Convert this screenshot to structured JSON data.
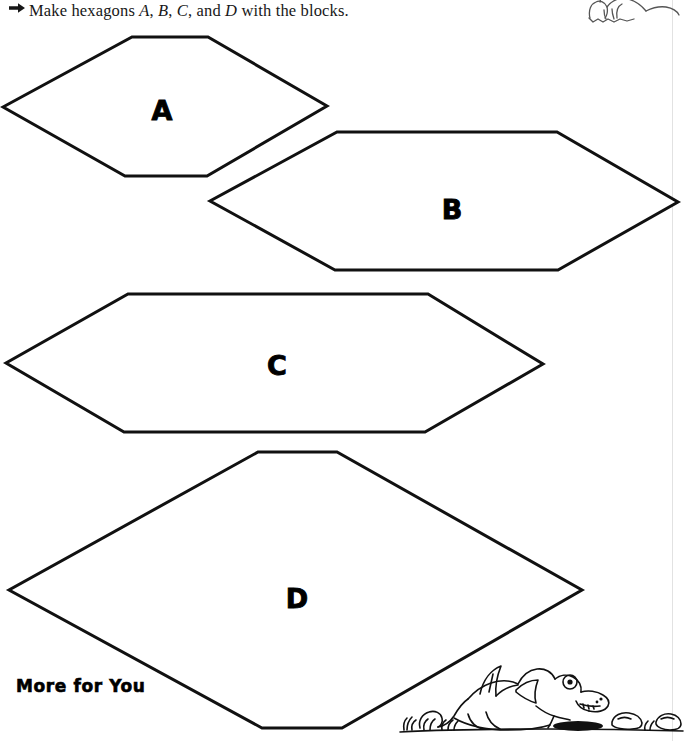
{
  "page": {
    "width": 685,
    "height": 741,
    "background_color": "#ffffff",
    "ink_color": "#111111"
  },
  "instruction": {
    "bullet_icon": "right-arrow-bullet",
    "prefix": "Make hexagons ",
    "label_a": "A",
    "sep1": ", ",
    "label_b": "B",
    "sep2": ", ",
    "label_c": "C",
    "sep3": ", and ",
    "label_d": "D",
    "suffix": " with the blocks.",
    "full_text": "Make hexagons A, B, C, and D with the blocks."
  },
  "shapes": [
    {
      "id": "hexagon-a",
      "label": "A",
      "label_x": 162,
      "label_y": 110,
      "points": "132,37 208,37 327,106 207,176 125,176 3,107",
      "stroke_width": 3
    },
    {
      "id": "hexagon-b",
      "label": "B",
      "label_x": 452,
      "label_y": 209,
      "points": "337,132 557,132 678,202 558,270 335,270 210,201",
      "stroke_width": 3
    },
    {
      "id": "hexagon-c",
      "label": "C",
      "label_x": 277,
      "label_y": 365,
      "points": "128,294 428,294 543,364 425,432 124,432 6,363",
      "stroke_width": 3
    },
    {
      "id": "hexagon-d",
      "label": "D",
      "label_x": 297,
      "label_y": 598,
      "points": "258,452 337,452 582,590 342,728 262,728 9,590",
      "stroke_width": 3
    }
  ],
  "footer": {
    "label": "More for You"
  },
  "decorations": [
    {
      "id": "art-top-creature",
      "name": "cartoon-dinosaur-partial",
      "description": "line-art cartoon creature cropped at top edge"
    },
    {
      "id": "art-bottom-dragon",
      "name": "cartoon-dragon-on-ground",
      "description": "line-art cartoon dragon lying on ground with grass tufts and rocks"
    }
  ]
}
